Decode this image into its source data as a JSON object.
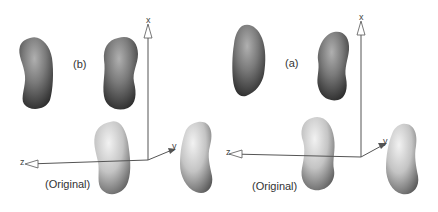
{
  "figure": {
    "panels": [
      {
        "id": "b",
        "label": "(b)",
        "original_label": "(Original)",
        "axes": {
          "x": "x",
          "y": "y",
          "z": "z"
        },
        "shapes": {
          "top_left": "smooth-kidney-dark",
          "top_right": "smooth-kidney-dark",
          "bottom_left": "original-kidney-light",
          "bottom_right": "original-kidney-light"
        }
      },
      {
        "id": "a",
        "label": "(a)",
        "original_label": "(Original)",
        "axes": {
          "x": "x",
          "y": "y",
          "z": "z"
        },
        "shapes": {
          "top_left": "rough-kidney-dark",
          "top_right": "rough-kidney-dark",
          "bottom_left": "original-kidney-light",
          "bottom_right": "original-kidney-light"
        }
      }
    ],
    "colors": {
      "background": "#ffffff",
      "dark_shape": "#6e6e6e",
      "light_shape": "#bdbdbd",
      "axis": "#555555",
      "text": "#333333"
    }
  }
}
